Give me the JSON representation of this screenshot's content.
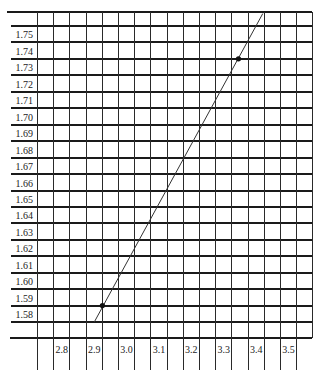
{
  "chart_data": {
    "type": "line",
    "title": "",
    "xlabel": "",
    "ylabel": "",
    "x_ticks": [
      "2.8",
      "2.9",
      "3.0",
      "3.1",
      "3.2",
      "3.3",
      "3.4",
      "3.5"
    ],
    "y_ticks": [
      "1.75",
      "1.74",
      "1.73",
      "1.72",
      "1.71",
      "1.70",
      "1.69",
      "1.68",
      "1.67",
      "1.66",
      "1.65",
      "1.64",
      "1.63",
      "1.62",
      "1.61",
      "1.60",
      "1.59",
      "1.58"
    ],
    "xlim": [
      2.7,
      3.55
    ],
    "ylim": [
      1.575,
      1.76
    ],
    "grid": true,
    "legend": null,
    "series": [
      {
        "name": "measured points",
        "kind": "scatter",
        "x": [
          2.9,
          3.32
        ],
        "y": [
          1.59,
          1.74
        ]
      },
      {
        "name": "fit line",
        "kind": "line",
        "x": [
          2.875,
          3.395
        ],
        "y": [
          1.58,
          1.7675
        ]
      }
    ]
  },
  "colors": {
    "grid": "#2a2a2a",
    "line": "#333333",
    "point": "#111111",
    "text": "#222222",
    "background": "#ffffff"
  }
}
